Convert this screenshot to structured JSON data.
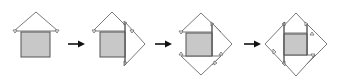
{
  "figure": {
    "steps": [
      {
        "label": "step-1",
        "flaps": [
          "top"
        ]
      },
      {
        "label": "step-2",
        "flaps": [
          "top",
          "right"
        ]
      },
      {
        "label": "step-3",
        "flaps": [
          "top",
          "right",
          "bottom"
        ]
      },
      {
        "label": "step-4",
        "flaps": [
          "top",
          "right",
          "bottom",
          "left"
        ]
      }
    ],
    "arrows": [
      {
        "from": "step-1",
        "to": "step-2"
      },
      {
        "from": "step-2",
        "to": "step-3"
      },
      {
        "from": "step-3",
        "to": "step-4"
      }
    ],
    "colors": {
      "square_fill": "#c8c8c8",
      "outline": "#555555",
      "flap_fill": "#ffffff",
      "arrow": "#111111"
    }
  }
}
